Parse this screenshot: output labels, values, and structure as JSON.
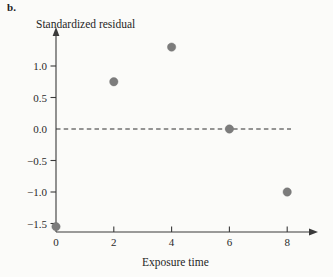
{
  "figure": {
    "panel_label": "b.",
    "y_axis_title": "Standardized residual",
    "x_axis_title": "Exposure time"
  },
  "chart_data": {
    "type": "scatter",
    "title": "",
    "xlabel": "Exposure time",
    "ylabel": "Standardized residual",
    "x": [
      0,
      2,
      4,
      6,
      8
    ],
    "values": [
      -1.55,
      0.75,
      1.3,
      0.0,
      -1.0
    ],
    "points": [
      {
        "x": 0,
        "y": -1.55
      },
      {
        "x": 2,
        "y": 0.75
      },
      {
        "x": 4,
        "y": 1.3
      },
      {
        "x": 6,
        "y": 0.0
      },
      {
        "x": 8,
        "y": -1.0
      }
    ],
    "xlim": [
      0,
      9.2
    ],
    "ylim": [
      -1.7,
      1.6
    ],
    "x_ticks": [
      0,
      2,
      4,
      6,
      8
    ],
    "x_tick_labels": [
      "0",
      "2",
      "4",
      "6",
      "8"
    ],
    "y_ticks": [
      1.0,
      0.5,
      0.0,
      -0.5,
      -1.0,
      -1.5
    ],
    "y_tick_labels": [
      "1.0",
      "0.5",
      "0.0",
      "−0.5",
      "−1.0",
      "−1.5"
    ],
    "grid": false,
    "legend": null,
    "reference_lines": [
      {
        "orientation": "horizontal",
        "value": 0.0,
        "style": "dashed"
      }
    ],
    "marker": {
      "shape": "circle",
      "color": "#7c7c7c",
      "size": 4.2
    },
    "axis_arrows": [
      "x-right",
      "y-up"
    ]
  },
  "colors": {
    "background": "#fbfbf9",
    "axis": "#3a3a3a",
    "text": "#1f1f1f",
    "marker": "#7c7c7c",
    "zero_line": "#2e2e2e"
  }
}
